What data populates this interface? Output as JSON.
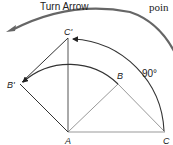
{
  "title": "Turn Arrow",
  "fragment_text": "poin",
  "angle_label": "90°",
  "points": {
    "A": {
      "label": "A",
      "x": 68,
      "y": 132
    },
    "B": {
      "label": "B",
      "x": 118,
      "y": 84
    },
    "C": {
      "label": "C",
      "x": 165,
      "y": 132
    },
    "B_prime": {
      "label": "B'",
      "x": 20,
      "y": 84
    },
    "C_prime": {
      "label": "C'",
      "x": 68,
      "y": 38
    }
  },
  "colors": {
    "line": "#333333",
    "light_line": "#888888",
    "arc": "#444444",
    "turn_arrow": "#555555"
  }
}
